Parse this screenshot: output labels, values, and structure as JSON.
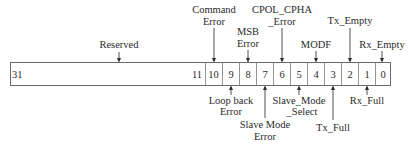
{
  "diagram": {
    "type": "register-bit-field",
    "register": {
      "bits": [
        "31",
        "11",
        "10",
        "9",
        "8",
        "7",
        "6",
        "5",
        "4",
        "3",
        "2",
        "1",
        "0"
      ],
      "reserved_range": {
        "high": "31",
        "low": "11"
      }
    },
    "labels_above": [
      {
        "id": "reserved",
        "line1": "Reserved",
        "line2": "",
        "bit": "31-11"
      },
      {
        "id": "command-error",
        "line1": "Command",
        "line2": "Error",
        "bit": "10"
      },
      {
        "id": "msb-error",
        "line1": "MSB",
        "line2": "Error",
        "bit": "8"
      },
      {
        "id": "cpol-cpha-error",
        "line1": "CPOL_CPHA",
        "line2": "_Error",
        "bit": "6"
      },
      {
        "id": "modf",
        "line1": "MODF",
        "line2": "",
        "bit": "4"
      },
      {
        "id": "tx-empty",
        "line1": "Tx_Empty",
        "line2": "",
        "bit": "2"
      },
      {
        "id": "rx-empty",
        "line1": "Rx_Empty",
        "line2": "",
        "bit": "0"
      }
    ],
    "labels_below": [
      {
        "id": "loop-back-error",
        "line1": "Loop back",
        "line2": "Error",
        "bit": "9"
      },
      {
        "id": "slave-mode-error",
        "line1": "Slave Mode",
        "line2": "Error",
        "bit": "7"
      },
      {
        "id": "slave-mode-select",
        "line1": "Slave_Mode",
        "line2": "_Select",
        "bit": "5"
      },
      {
        "id": "tx-full",
        "line1": "Tx_Full",
        "line2": "",
        "bit": "3"
      },
      {
        "id": "rx-full",
        "line1": "Rx_Full",
        "line2": "",
        "bit": "1"
      }
    ]
  }
}
